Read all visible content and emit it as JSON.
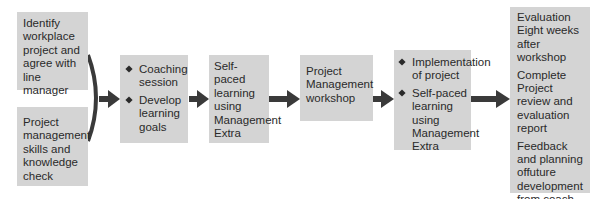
{
  "diagram": {
    "box_color": "#d4d4d4",
    "arrow_color": "#3a3a3a",
    "inputs": [
      {
        "id": "identify-project",
        "lines": [
          "Identify",
          "workplace",
          "project and",
          "agree with",
          "line manager"
        ]
      },
      {
        "id": "skills-check",
        "lines": [
          "Project",
          "management",
          "skills and",
          "knowledge",
          "check"
        ]
      }
    ],
    "steps": [
      {
        "id": "coaching",
        "bullets": [
          "Coaching session",
          "Develop learning goals"
        ]
      },
      {
        "id": "self-paced-1",
        "text": "Self-paced learning using Management Extra"
      },
      {
        "id": "workshop",
        "text": "Project Management workshop"
      },
      {
        "id": "implementation",
        "bullets": [
          "Implementation of project",
          "Self-paced learning using Management Extra"
        ]
      },
      {
        "id": "evaluation",
        "paragraphs": [
          "Evaluation Eight weeks after workshop",
          "Complete Project review and evaluation report",
          "Feedback and planning offuture development from coach"
        ]
      }
    ]
  }
}
